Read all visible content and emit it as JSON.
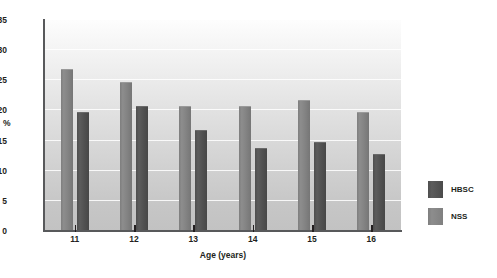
{
  "figure": {
    "clipped_title_remnant": "",
    "background_color": "#ffffff"
  },
  "axes": {
    "y_title": "%",
    "x_title": "Age (years)",
    "y_ticks": [
      "0",
      "5",
      "10",
      "15",
      "20",
      "25",
      "30",
      "35"
    ],
    "x_ticks": [
      "11",
      "12",
      "13",
      "14",
      "15",
      "16"
    ]
  },
  "legend": {
    "items": [
      {
        "label": "HBSC",
        "color": "#4e4e4e"
      },
      {
        "label": "NSS",
        "color": "#8d8d8d"
      }
    ]
  },
  "chart_data": {
    "type": "bar",
    "title": "",
    "xlabel": "Age (years)",
    "ylabel": "%",
    "categories": [
      "11",
      "12",
      "13",
      "14",
      "15",
      "16"
    ],
    "ylim": [
      0,
      35
    ],
    "ytick_step": 5,
    "grid": true,
    "legend_position": "right",
    "series": [
      {
        "name": "NSS",
        "color": "#8d8d8d",
        "values": [
          26.8,
          24.8,
          20.8,
          20.8,
          21.7,
          19.7
        ]
      },
      {
        "name": "HBSC",
        "color": "#4e4e4e",
        "values": [
          19.8,
          20.8,
          16.8,
          13.8,
          14.8,
          12.8
        ]
      }
    ]
  }
}
